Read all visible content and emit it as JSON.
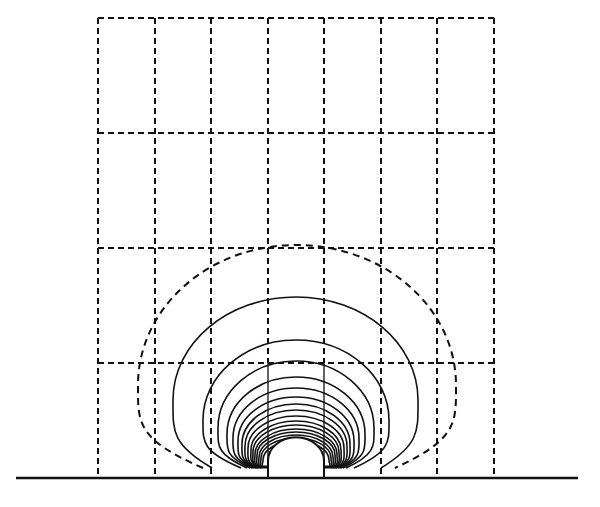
{
  "figure": {
    "description": "Equipotential / field contour lines around a semicircular boss on a ground plane, overlaid on a dashed rectangular mesh",
    "colors": {
      "ink": "#111111",
      "background": "#ffffff"
    },
    "grid": {
      "x_lines": [
        98,
        155,
        211,
        268,
        324,
        381,
        437,
        494
      ],
      "y_lines": [
        18,
        133,
        248,
        363
      ],
      "bottom": 478,
      "columns": 7,
      "rows": 4
    },
    "baseline": {
      "x1": 16,
      "x2": 578,
      "y": 478
    },
    "boss": {
      "cx": 296,
      "base_y": 467,
      "radius": 28,
      "ledge_left": 255,
      "ledge_right": 337
    },
    "contour_center_x": 296,
    "contours": [
      {
        "style": "dashed",
        "top": 245,
        "left": 138,
        "right": 456,
        "mid_y": 385,
        "end_left": 203,
        "end_right": 395,
        "end_y": 468
      },
      {
        "style": "solid",
        "top": 297,
        "left": 173,
        "right": 418,
        "mid_y": 400,
        "end_left": 212,
        "end_right": 381,
        "end_y": 468
      },
      {
        "style": "solid",
        "top": 340,
        "left": 203,
        "right": 389,
        "mid_y": 420,
        "end_left": 241,
        "end_right": 354,
        "end_y": 468
      },
      {
        "style": "solid",
        "top": 361,
        "left": 218,
        "right": 374,
        "mid_y": 428,
        "end_left": 247,
        "end_right": 346,
        "end_y": 468
      },
      {
        "style": "solid",
        "top": 377,
        "left": 227,
        "right": 365,
        "mid_y": 434,
        "end_left": 250,
        "end_right": 343,
        "end_y": 468
      },
      {
        "style": "solid",
        "top": 388,
        "left": 233,
        "right": 359,
        "mid_y": 438,
        "end_left": 252,
        "end_right": 341,
        "end_y": 468
      },
      {
        "style": "solid",
        "top": 397,
        "left": 238,
        "right": 354,
        "mid_y": 441,
        "end_left": 253,
        "end_right": 340,
        "end_y": 468
      },
      {
        "style": "solid",
        "top": 404,
        "left": 242,
        "right": 350,
        "mid_y": 444,
        "end_left": 254,
        "end_right": 339,
        "end_y": 468
      },
      {
        "style": "solid",
        "top": 410,
        "left": 245,
        "right": 347,
        "mid_y": 446,
        "end_left": 255,
        "end_right": 338,
        "end_y": 468
      },
      {
        "style": "solid",
        "top": 416,
        "left": 248,
        "right": 344,
        "mid_y": 448,
        "end_left": 256,
        "end_right": 337,
        "end_y": 468
      },
      {
        "style": "solid",
        "top": 421,
        "left": 251,
        "right": 341,
        "mid_y": 450,
        "end_left": 257,
        "end_right": 336,
        "end_y": 468
      },
      {
        "style": "solid",
        "top": 425,
        "left": 253,
        "right": 339,
        "mid_y": 452,
        "end_left": 258,
        "end_right": 335,
        "end_y": 468
      },
      {
        "style": "solid",
        "top": 429,
        "left": 255,
        "right": 337,
        "mid_y": 454,
        "end_left": 259,
        "end_right": 334,
        "end_y": 468
      },
      {
        "style": "solid",
        "top": 432,
        "left": 257,
        "right": 335,
        "mid_y": 455,
        "end_left": 260,
        "end_right": 333,
        "end_y": 468
      },
      {
        "style": "solid",
        "top": 435,
        "left": 259,
        "right": 333,
        "mid_y": 457,
        "end_left": 261,
        "end_right": 332,
        "end_y": 468
      },
      {
        "style": "solid",
        "top": 438,
        "left": 261,
        "right": 331,
        "mid_y": 458,
        "end_left": 262,
        "end_right": 331,
        "end_y": 468
      },
      {
        "style": "solid",
        "top": 441,
        "left": 263,
        "right": 329,
        "mid_y": 460,
        "end_left": 263,
        "end_right": 330,
        "end_y": 468
      }
    ]
  }
}
